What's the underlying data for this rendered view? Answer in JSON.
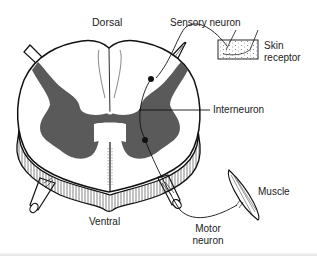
{
  "diagram": {
    "labels": {
      "dorsal": "Dorsal",
      "ventral": "Ventral",
      "sensory_neuron": "Sensory neuron",
      "skin_receptor_line1": "Skin",
      "skin_receptor_line2": "receptor",
      "interneuron": "Interneuron",
      "muscle": "Muscle",
      "motor_neuron_line1": "Motor",
      "motor_neuron_line2": "neuron"
    },
    "colors": {
      "gray_matter": "#5a5a5a",
      "outline": "#111111",
      "background": "#ffffff",
      "text": "#222222"
    }
  }
}
